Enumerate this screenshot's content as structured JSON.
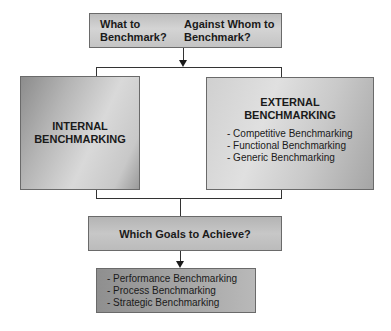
{
  "diagram": {
    "top_box": {
      "question_1": [
        "What to",
        "Benchmark?"
      ],
      "question_2": [
        "Against Whom to",
        "Benchmark?"
      ]
    },
    "internal": {
      "title_line_1": "INTERNAL",
      "title_line_2": "BENCHMARKING"
    },
    "external": {
      "title_line_1": "EXTERNAL",
      "title_line_2": "BENCHMARKING",
      "items": [
        "- Competitive Benchmarking",
        "- Functional Benchmarking",
        "- Generic Benchmarking"
      ]
    },
    "goals_box": {
      "title": "Which Goals to Achieve?"
    },
    "bottom_box": {
      "items": [
        "- Performance Benchmarking",
        "- Process Benchmarking",
        "- Strategic Benchmarking"
      ]
    }
  },
  "colors": {
    "line": "#333333",
    "border": "#6a6a6a",
    "text": "#1a1a1a"
  }
}
